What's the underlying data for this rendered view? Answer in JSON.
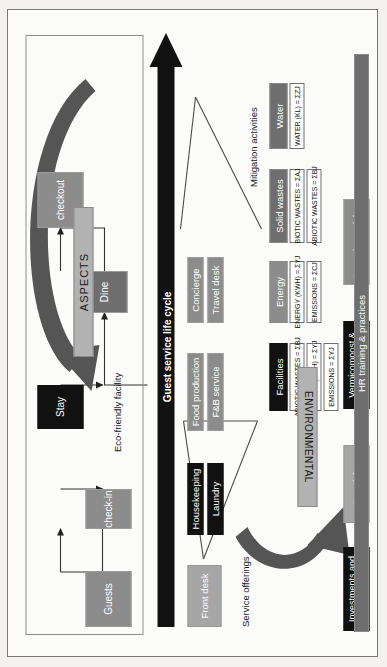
{
  "diagram": {
    "title_flow_arrow": "Guest service life cycle",
    "group_labels": {
      "service_offerings": "Service offerings",
      "mitigation_activities": "Mitigation activities",
      "eco_friendly_facility": "Eco-friendly facility"
    },
    "banners": {
      "aspects": "ASPECTS",
      "environmental": "ENVIRONMENTAL"
    },
    "lifecycle": {
      "nodes": [
        {
          "label": "Guests",
          "style": "gray-md"
        },
        {
          "label": "check-in",
          "style": "gray-md"
        },
        {
          "label": "Stay",
          "style": "black"
        },
        {
          "label": "Dine",
          "style": "gray-dk"
        },
        {
          "label": "checkout",
          "style": "gray-md"
        }
      ]
    },
    "service_offerings": [
      {
        "label": "Front desk",
        "style": "gray-lt"
      },
      {
        "label": "Housekeeping",
        "style": "black"
      },
      {
        "label": "Laundry",
        "style": "black"
      },
      {
        "label": "Food production",
        "style": "gray-md"
      },
      {
        "label": "F&B service",
        "style": "gray-md"
      },
      {
        "label": "Concierge",
        "style": "gray-md"
      },
      {
        "label": "Travel desk",
        "style": "gray-md"
      }
    ],
    "aspect_groups": [
      {
        "header": "Facilities",
        "header_style": "black",
        "rows": [
          "ABIOTIC WASTES = ΣBJ",
          "ENERGY (KWH) = ΣYJ",
          "EMISSIONS = ΣYJ"
        ]
      },
      {
        "header": "Energy",
        "header_style": "gray-md",
        "rows": [
          "ENERGY (KWH) = ΣYJ",
          "EMISSIONS = ΣCJ"
        ]
      },
      {
        "header": "Solid wastes",
        "header_style": "gray-dk",
        "rows": [
          "BIOTIC WASTES = ΣAJ",
          "ABIOTIC WASTES = ΣBJ"
        ]
      },
      {
        "header": "Water",
        "header_style": "gray-dk",
        "rows": [
          "WATER (KL) = ΣZJ"
        ]
      }
    ],
    "mitigation": [
      {
        "label": "Investments and certifications",
        "style": "black"
      },
      {
        "label": "Eco-nights",
        "style": "gray-lt"
      },
      {
        "label": "Vermicompost & SWM",
        "style": "black"
      },
      {
        "label": "Save planet nights",
        "style": "gray-md"
      }
    ],
    "hr_bar": {
      "label": "HR training & practices",
      "style": "gray-dk"
    },
    "colors": {
      "gray_light": "#a6a6a6",
      "gray_medium": "#8c8c8c",
      "gray_dark": "#6e6e6e",
      "black": "#111111",
      "aspect_banner": "#b2b2b2",
      "background": "#fbfbfa"
    }
  }
}
